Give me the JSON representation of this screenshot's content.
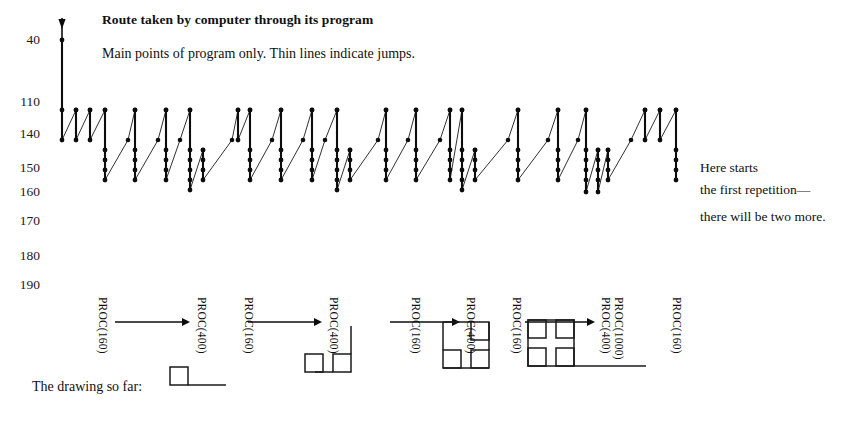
{
  "header": {
    "title": "Route taken by computer through its program",
    "subtitle": "Main points of program only. Thin lines indicate jumps."
  },
  "side_note": {
    "line1": "Here starts",
    "line2": "the first repetition—",
    "line3": "there will be two more."
  },
  "drawing_label": "The drawing so far:",
  "axis": {
    "ticks": [
      {
        "label": "40",
        "y": 40
      },
      {
        "label": "110",
        "y": 102
      },
      {
        "label": "140",
        "y": 134
      },
      {
        "label": "150",
        "y": 168
      },
      {
        "label": "160",
        "y": 192
      },
      {
        "label": "170",
        "y": 221
      },
      {
        "label": "180",
        "y": 256
      },
      {
        "label": "190",
        "y": 285
      }
    ]
  },
  "proc_labels": [
    {
      "text": "PROC(160)",
      "x": 97,
      "y": 297
    },
    {
      "text": "PROC(400)",
      "x": 196,
      "y": 297
    },
    {
      "text": "PROC(160)",
      "x": 243,
      "y": 297
    },
    {
      "text": "PROC(400)",
      "x": 328,
      "y": 297
    },
    {
      "text": "PROC(160)",
      "x": 410,
      "y": 297
    },
    {
      "text": "PROC(400)",
      "x": 465,
      "y": 297
    },
    {
      "text": "PROC(160)",
      "x": 511,
      "y": 297
    },
    {
      "text": "PROC(400)",
      "x": 600,
      "y": 297
    },
    {
      "text": "PROC(1000)",
      "x": 613,
      "y": 297
    },
    {
      "text": "PROC(160)",
      "x": 671,
      "y": 297
    }
  ],
  "arrows": [
    {
      "x1": 115,
      "x2": 190,
      "y": 322
    },
    {
      "x1": 248,
      "x2": 322,
      "y": 322
    },
    {
      "x1": 390,
      "x2": 460,
      "y": 322
    },
    {
      "x1": 525,
      "x2": 595,
      "y": 322
    }
  ],
  "chart_data": {
    "type": "line",
    "title": "Route taken by computer through its program",
    "subtitle": "Main points of program only. Thin lines indicate jumps.",
    "ylabel": "",
    "xlabel": "",
    "y_axis_type": "program line numbers (non-linear ticks)",
    "y_ticks": [
      40,
      110,
      140,
      150,
      160,
      170,
      180,
      190
    ],
    "y_tick_pixels": [
      40,
      102,
      134,
      168,
      192,
      221,
      256,
      285
    ],
    "grid": false,
    "legend": null,
    "entry_arrow": {
      "x": 62,
      "y_from": 18,
      "y_to": 40
    },
    "traces": [
      {
        "kind": "thick",
        "x": 62,
        "points": [
          40,
          110,
          140
        ]
      },
      {
        "kind": "thin",
        "from": [
          62,
          140
        ],
        "to": [
          76,
          110
        ]
      },
      {
        "kind": "thick",
        "x": 76,
        "points": [
          110,
          140
        ]
      },
      {
        "kind": "thin",
        "from": [
          76,
          140
        ],
        "to": [
          90,
          110
        ]
      },
      {
        "kind": "thick",
        "x": 90,
        "points": [
          110,
          140
        ]
      },
      {
        "kind": "thin",
        "from": [
          90,
          140
        ],
        "to": [
          105,
          110
        ]
      },
      {
        "kind": "thick",
        "x": 105,
        "points": [
          110,
          150,
          160,
          170,
          180
        ]
      },
      {
        "kind": "thin",
        "from": [
          105,
          180
        ],
        "to": [
          128,
          140
        ]
      },
      {
        "kind": "thin",
        "from": [
          128,
          140
        ],
        "to": [
          135,
          110
        ]
      },
      {
        "kind": "thick",
        "x": 135,
        "points": [
          110,
          150,
          160,
          170,
          180
        ]
      },
      {
        "kind": "thin",
        "from": [
          135,
          180
        ],
        "to": [
          158,
          140
        ]
      },
      {
        "kind": "thin",
        "from": [
          158,
          140
        ],
        "to": [
          166,
          110
        ]
      },
      {
        "kind": "thick",
        "x": 166,
        "points": [
          110,
          150,
          160,
          170,
          180
        ]
      },
      {
        "kind": "thin",
        "from": [
          166,
          180
        ],
        "to": [
          180,
          140
        ]
      },
      {
        "kind": "thin",
        "from": [
          180,
          140
        ],
        "to": [
          190,
          110
        ]
      },
      {
        "kind": "thick",
        "x": 190,
        "points": [
          110,
          150,
          160,
          170,
          180,
          190
        ]
      },
      {
        "kind": "thin",
        "from": [
          190,
          190
        ],
        "to": [
          203,
          150
        ]
      },
      {
        "kind": "thick",
        "x": 203,
        "points": [
          150,
          160,
          170,
          180
        ]
      },
      {
        "kind": "thin",
        "from": [
          203,
          180
        ],
        "to": [
          232,
          140
        ]
      },
      {
        "kind": "thin",
        "from": [
          232,
          140
        ],
        "to": [
          238,
          110
        ]
      },
      {
        "kind": "thick",
        "x": 238,
        "points": [
          110,
          140
        ]
      },
      {
        "kind": "thin",
        "from": [
          238,
          140
        ],
        "to": [
          250,
          110
        ]
      },
      {
        "kind": "thick",
        "x": 250,
        "points": [
          110,
          150,
          160,
          170,
          180
        ]
      },
      {
        "kind": "thin",
        "from": [
          250,
          180
        ],
        "to": [
          272,
          140
        ]
      },
      {
        "kind": "thin",
        "from": [
          272,
          140
        ],
        "to": [
          281,
          110
        ]
      },
      {
        "kind": "thick",
        "x": 281,
        "points": [
          110,
          150,
          160,
          170,
          180
        ]
      },
      {
        "kind": "thin",
        "from": [
          281,
          180
        ],
        "to": [
          303,
          140
        ]
      },
      {
        "kind": "thin",
        "from": [
          303,
          140
        ],
        "to": [
          312,
          110
        ]
      },
      {
        "kind": "thick",
        "x": 312,
        "points": [
          110,
          150,
          160,
          170,
          180
        ]
      },
      {
        "kind": "thin",
        "from": [
          312,
          180
        ],
        "to": [
          325,
          140
        ]
      },
      {
        "kind": "thin",
        "from": [
          325,
          140
        ],
        "to": [
          337,
          110
        ]
      },
      {
        "kind": "thick",
        "x": 337,
        "points": [
          110,
          150,
          160,
          170,
          180,
          190
        ]
      },
      {
        "kind": "thin",
        "from": [
          337,
          190
        ],
        "to": [
          350,
          150
        ]
      },
      {
        "kind": "thick",
        "x": 350,
        "points": [
          150,
          160,
          170,
          180
        ]
      },
      {
        "kind": "thin",
        "from": [
          350,
          180
        ],
        "to": [
          378,
          140
        ]
      },
      {
        "kind": "thin",
        "from": [
          378,
          140
        ],
        "to": [
          386,
          110
        ]
      },
      {
        "kind": "thick",
        "x": 386,
        "points": [
          110,
          150,
          160,
          170,
          180
        ]
      },
      {
        "kind": "thin",
        "from": [
          386,
          180
        ],
        "to": [
          408,
          140
        ]
      },
      {
        "kind": "thin",
        "from": [
          408,
          140
        ],
        "to": [
          416,
          110
        ]
      },
      {
        "kind": "thick",
        "x": 416,
        "points": [
          110,
          150,
          160,
          170,
          180
        ]
      },
      {
        "kind": "thin",
        "from": [
          416,
          180
        ],
        "to": [
          440,
          140
        ]
      },
      {
        "kind": "thin",
        "from": [
          440,
          140
        ],
        "to": [
          450,
          110
        ]
      },
      {
        "kind": "thick",
        "x": 450,
        "points": [
          110,
          150,
          160,
          170,
          180
        ]
      },
      {
        "kind": "thin",
        "from": [
          450,
          180
        ],
        "to": [
          462,
          110
        ]
      },
      {
        "kind": "thick",
        "x": 462,
        "points": [
          110,
          150,
          160,
          170,
          180,
          190
        ]
      },
      {
        "kind": "thin",
        "from": [
          462,
          190
        ],
        "to": [
          475,
          150
        ]
      },
      {
        "kind": "thick",
        "x": 475,
        "points": [
          150,
          160,
          170,
          180
        ]
      },
      {
        "kind": "thin",
        "from": [
          475,
          180
        ],
        "to": [
          508,
          140
        ]
      },
      {
        "kind": "thin",
        "from": [
          508,
          140
        ],
        "to": [
          518,
          110
        ]
      },
      {
        "kind": "thick",
        "x": 518,
        "points": [
          110,
          150,
          160,
          170,
          180
        ]
      },
      {
        "kind": "thin",
        "from": [
          518,
          180
        ],
        "to": [
          548,
          140
        ]
      },
      {
        "kind": "thin",
        "from": [
          548,
          140
        ],
        "to": [
          558,
          110
        ]
      },
      {
        "kind": "thick",
        "x": 558,
        "points": [
          110,
          150,
          160,
          170,
          180
        ]
      },
      {
        "kind": "thin",
        "from": [
          558,
          180
        ],
        "to": [
          578,
          140
        ]
      },
      {
        "kind": "thin",
        "from": [
          578,
          140
        ],
        "to": [
          586,
          110
        ]
      },
      {
        "kind": "thick",
        "x": 586,
        "points": [
          110,
          150,
          160,
          170,
          180,
          192
        ]
      },
      {
        "kind": "thin",
        "from": [
          586,
          192
        ],
        "to": [
          598,
          150
        ]
      },
      {
        "kind": "thick",
        "x": 598,
        "points": [
          150,
          160,
          170,
          180,
          192
        ]
      },
      {
        "kind": "thin",
        "from": [
          598,
          192
        ],
        "to": [
          608,
          150
        ]
      },
      {
        "kind": "thick",
        "x": 608,
        "points": [
          150,
          160,
          170,
          180
        ]
      },
      {
        "kind": "thin",
        "from": [
          608,
          180
        ],
        "to": [
          631,
          140
        ]
      },
      {
        "kind": "thin",
        "from": [
          631,
          140
        ],
        "to": [
          645,
          110
        ]
      },
      {
        "kind": "thick",
        "x": 645,
        "points": [
          110,
          140
        ]
      },
      {
        "kind": "thin",
        "from": [
          645,
          140
        ],
        "to": [
          660,
          110
        ]
      },
      {
        "kind": "thick",
        "x": 660,
        "points": [
          110,
          140
        ]
      },
      {
        "kind": "thin",
        "from": [
          660,
          140
        ],
        "to": [
          676,
          110
        ]
      },
      {
        "kind": "thick",
        "x": 676,
        "points": [
          110,
          150,
          160,
          170,
          180
        ]
      }
    ]
  },
  "drawings": [
    {
      "name": "drawing-1",
      "x": 170,
      "y": 385
    },
    {
      "name": "drawing-2",
      "x": 305,
      "y": 372
    },
    {
      "name": "drawing-3",
      "x": 443,
      "y": 368
    },
    {
      "name": "drawing-4",
      "x": 528,
      "y": 366
    }
  ]
}
